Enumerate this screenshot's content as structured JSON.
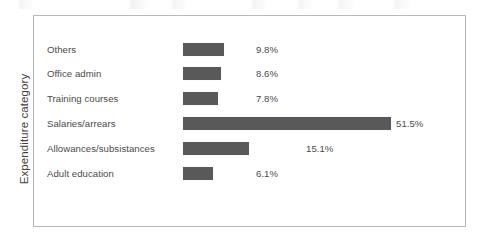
{
  "chart_data": {
    "type": "bar",
    "orientation": "horizontal",
    "title": "",
    "xlabel": "",
    "ylabel": "Expenditure category",
    "grid": false,
    "legend": false,
    "categories": [
      "Others",
      "Office admin",
      "Training courses",
      "Salaries/arrears",
      "Allowances/subsistances",
      "Adult education"
    ],
    "values": [
      9.8,
      8.6,
      7.8,
      51.5,
      15.1,
      6.1
    ],
    "value_labels": [
      "9.8%",
      "8.6%",
      "7.8%",
      "51.5%",
      "15.1%",
      "6.1%"
    ],
    "unit": "%",
    "bar_color": "#595959",
    "text_color": "#4a4a4a",
    "frame_color": "#b9b9b9",
    "background": "#ffffff",
    "rows": [
      {
        "label": "Others",
        "value": 9.8,
        "value_label": "9.8%",
        "row_top": 26,
        "bar_left": 149,
        "bar_width": 41,
        "label_left": 222
      },
      {
        "label": "Office admin",
        "value": 8.6,
        "value_label": "8.6%",
        "row_top": 50,
        "bar_left": 149,
        "bar_width": 38,
        "label_left": 222
      },
      {
        "label": "Training courses",
        "value": 7.8,
        "value_label": "7.8%",
        "row_top": 75,
        "bar_left": 149,
        "bar_width": 35,
        "label_left": 222
      },
      {
        "label": "Salaries/arrears",
        "value": 51.5,
        "value_label": "51.5%",
        "row_top": 100,
        "bar_left": 149,
        "bar_width": 208,
        "label_left": 362
      },
      {
        "label": "Allowances/subsistances",
        "value": 15.1,
        "value_label": "15.1%",
        "row_top": 125,
        "bar_left": 149,
        "bar_width": 66,
        "label_left": 272
      },
      {
        "label": "Adult education",
        "value": 6.1,
        "value_label": "6.1%",
        "row_top": 150,
        "bar_left": 149,
        "bar_width": 30,
        "label_left": 222
      }
    ]
  }
}
